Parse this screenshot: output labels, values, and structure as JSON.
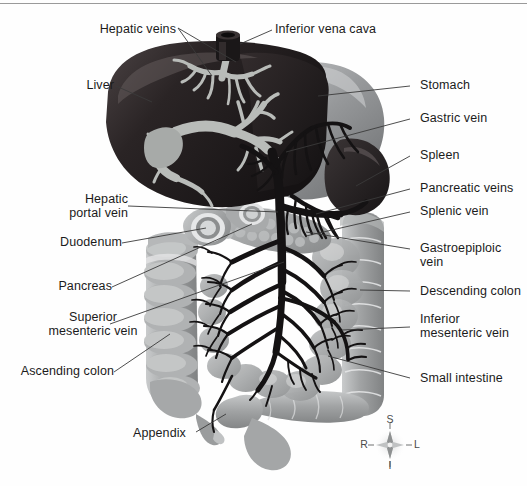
{
  "figure": {
    "type": "anatomical-illustration",
    "border": {
      "top_rule_color": "#9a9a9a"
    },
    "palette": {
      "background": "#fefefe",
      "liver_dark": "#241f20",
      "liver_mid": "#3c3536",
      "vein_light": "#b9bcb9",
      "stomach_mid": "#8f9193",
      "stomach_light": "#b6b8ba",
      "spleen_dark": "#2e2a2b",
      "vein_dark": "#151314",
      "colon_gray": "#9ea0a1",
      "colon_light": "#c6c8c9",
      "pancreas_gray": "#a9aaab",
      "label_text": "#1b1b1b",
      "leader_line": "#3a3a3a",
      "compass_text": "#4a4a4a"
    }
  },
  "labels": {
    "hepatic_veins": "Hepatic veins",
    "inferior_vena_cava": "Inferior vena cava",
    "liver": "Liver",
    "stomach": "Stomach",
    "gastric_vein": "Gastric vein",
    "spleen": "Spleen",
    "pancreatic_veins": "Pancreatic veins",
    "splenic_vein": "Splenic vein",
    "hepatic_portal_vein": "Hepatic\nportal vein",
    "duodenum": "Duodenum",
    "pancreas": "Pancreas",
    "gastroepiploic_vein": "Gastroepiploic\nvein",
    "descending_colon": "Descending colon",
    "superior_mesenteric_vein": "Superior\nmesenteric vein",
    "inferior_mesenteric_vein": "Inferior\nmesenteric vein",
    "ascending_colon": "Ascending colon",
    "small_intestine": "Small intestine",
    "appendix": "Appendix"
  },
  "compass": {
    "superior": "S",
    "inferior": "I",
    "right": "R",
    "left": "L"
  }
}
